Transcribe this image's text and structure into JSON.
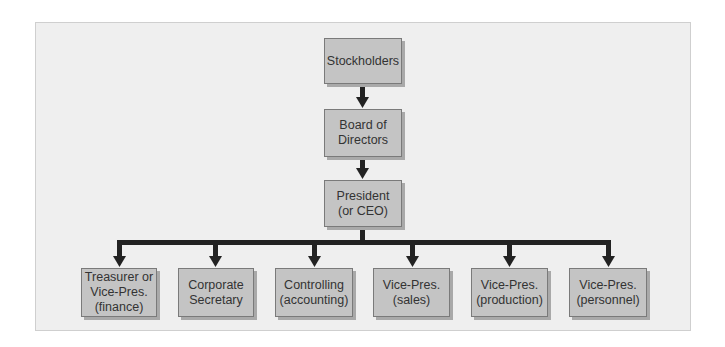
{
  "diagram": {
    "colors": {
      "panel_bg": "#efefef",
      "box_fill": "#c4c4c4",
      "box_border": "#7a7a7a",
      "connector": "#222222",
      "text": "#333333"
    },
    "nodes": {
      "stockholders": {
        "label": "Stockholders"
      },
      "board": {
        "label": "Board of\nDirectors"
      },
      "president": {
        "label": "President\n(or CEO)"
      },
      "treasurer": {
        "label": "Treasurer or\nVice-Pres.\n(finance)"
      },
      "secretary": {
        "label": "Corporate\nSecretary"
      },
      "controlling": {
        "label": "Controlling\n(accounting)"
      },
      "vp_sales": {
        "label": "Vice-Pres.\n(sales)"
      },
      "vp_production": {
        "label": "Vice-Pres.\n(production)"
      },
      "vp_personnel": {
        "label": "Vice-Pres.\n(personnel)"
      }
    },
    "edges": [
      [
        "stockholders",
        "board"
      ],
      [
        "board",
        "president"
      ],
      [
        "president",
        "treasurer"
      ],
      [
        "president",
        "secretary"
      ],
      [
        "president",
        "controlling"
      ],
      [
        "president",
        "vp_sales"
      ],
      [
        "president",
        "vp_production"
      ],
      [
        "president",
        "vp_personnel"
      ]
    ]
  }
}
